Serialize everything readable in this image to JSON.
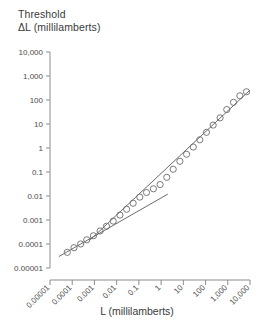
{
  "chart_data": {
    "type": "scatter",
    "title": "Threshold\nΔL (millilamberts)",
    "ylabel": "Threshold ΔL (millilamberts)",
    "xlabel": "L (millilamberts)",
    "xscale": "log",
    "yscale": "log",
    "xlim": [
      1e-05,
      10000
    ],
    "ylim": [
      1e-05,
      10000
    ],
    "grid": false,
    "legend": null,
    "marker": "open-circle",
    "color": "#6b6b6b",
    "xtick_labels": [
      "0.00001",
      "0.0001",
      "0.001",
      "0.01",
      "0.1",
      "1",
      "10",
      "100",
      "1,000",
      "10,000"
    ],
    "ytick_labels": [
      "0.00001",
      "0.0001",
      "0.001",
      "0.01",
      "0.1",
      "1",
      "10",
      "100",
      "1,000",
      "10,000"
    ],
    "xticks": [
      1e-05,
      0.0001,
      0.001,
      0.01,
      0.1,
      1,
      10,
      100,
      1000,
      10000
    ],
    "yticks": [
      1e-05,
      0.0001,
      0.001,
      0.01,
      0.1,
      1,
      10,
      100,
      1000,
      10000
    ],
    "points": [
      {
        "x": 6e-05,
        "y": 4.5e-05
      },
      {
        "x": 0.00012,
        "y": 7e-05
      },
      {
        "x": 0.00024,
        "y": 0.0001
      },
      {
        "x": 0.00045,
        "y": 0.00015
      },
      {
        "x": 0.0009,
        "y": 0.00022
      },
      {
        "x": 0.0018,
        "y": 0.00035
      },
      {
        "x": 0.0035,
        "y": 0.00055
      },
      {
        "x": 0.007,
        "y": 0.0009
      },
      {
        "x": 0.014,
        "y": 0.0016
      },
      {
        "x": 0.028,
        "y": 0.0028
      },
      {
        "x": 0.055,
        "y": 0.005
      },
      {
        "x": 0.11,
        "y": 0.009
      },
      {
        "x": 0.22,
        "y": 0.014
      },
      {
        "x": 0.45,
        "y": 0.02
      },
      {
        "x": 0.9,
        "y": 0.03
      },
      {
        "x": 1.8,
        "y": 0.06
      },
      {
        "x": 3.5,
        "y": 0.13
      },
      {
        "x": 7.0,
        "y": 0.28
      },
      {
        "x": 14.0,
        "y": 0.55
      },
      {
        "x": 28.0,
        "y": 1.1
      },
      {
        "x": 55.0,
        "y": 2.2
      },
      {
        "x": 110.0,
        "y": 4.5
      },
      {
        "x": 220.0,
        "y": 9.0
      },
      {
        "x": 450.0,
        "y": 18.0
      },
      {
        "x": 900.0,
        "y": 40.0
      },
      {
        "x": 1800.0,
        "y": 80.0
      },
      {
        "x": 3500.0,
        "y": 150.0
      },
      {
        "x": 7000.0,
        "y": 220.0
      }
    ],
    "fit_segments": [
      {
        "name": "lower-branch",
        "comment": "shallow rod / dark-light branch",
        "from": {
          "x": 2.5e-05,
          "y": 3e-05
        },
        "to": {
          "x": 2.0,
          "y": 0.012
        }
      },
      {
        "name": "weber-branch",
        "comment": "unity-slope Weber's law branch",
        "from": {
          "x": 0.0006,
          "y": 0.00014
        },
        "to": {
          "x": 10000.0,
          "y": 260.0
        }
      }
    ]
  }
}
